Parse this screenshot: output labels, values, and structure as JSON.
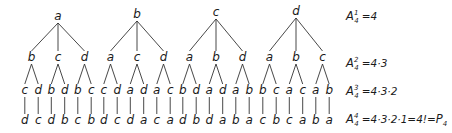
{
  "diagram": {
    "trees": [
      {
        "root": "a",
        "children": [
          {
            "label": "b",
            "children": [
              {
                "label": "c",
                "leaf": "d"
              },
              {
                "label": "d",
                "leaf": "c"
              }
            ]
          },
          {
            "label": "c",
            "children": [
              {
                "label": "b",
                "leaf": "d"
              },
              {
                "label": "d",
                "leaf": "b"
              }
            ]
          },
          {
            "label": "d",
            "children": [
              {
                "label": "b",
                "leaf": "c"
              },
              {
                "label": "c",
                "leaf": "b"
              }
            ]
          }
        ]
      },
      {
        "root": "b",
        "children": [
          {
            "label": "a",
            "children": [
              {
                "label": "c",
                "leaf": "d"
              },
              {
                "label": "d",
                "leaf": "c"
              }
            ]
          },
          {
            "label": "c",
            "children": [
              {
                "label": "a",
                "leaf": "d"
              },
              {
                "label": "d",
                "leaf": "a"
              }
            ]
          },
          {
            "label": "d",
            "children": [
              {
                "label": "a",
                "leaf": "c"
              },
              {
                "label": "c",
                "leaf": "a"
              }
            ]
          }
        ]
      },
      {
        "root": "c",
        "children": [
          {
            "label": "a",
            "children": [
              {
                "label": "b",
                "leaf": "d"
              },
              {
                "label": "d",
                "leaf": "b"
              }
            ]
          },
          {
            "label": "b",
            "children": [
              {
                "label": "a",
                "leaf": "d"
              },
              {
                "label": "d",
                "leaf": "a"
              }
            ]
          },
          {
            "label": "d",
            "children": [
              {
                "label": "a",
                "leaf": "b"
              },
              {
                "label": "b",
                "leaf": "a"
              }
            ]
          }
        ]
      },
      {
        "root": "d",
        "children": [
          {
            "label": "a",
            "children": [
              {
                "label": "b",
                "leaf": "c"
              },
              {
                "label": "c",
                "leaf": "b"
              }
            ]
          },
          {
            "label": "b",
            "children": [
              {
                "label": "a",
                "leaf": "c"
              },
              {
                "label": "c",
                "leaf": "a"
              }
            ]
          },
          {
            "label": "c",
            "children": [
              {
                "label": "a",
                "leaf": "b"
              },
              {
                "label": "b",
                "leaf": "a"
              }
            ]
          }
        ]
      }
    ],
    "formulas": [
      {
        "base": "A",
        "sup": "1",
        "sub": "4",
        "rhs": "=4"
      },
      {
        "base": "A",
        "sup": "2",
        "sub": "4",
        "rhs": "=4·3"
      },
      {
        "base": "A",
        "sup": "3",
        "sub": "4",
        "rhs": "=4·3·2"
      },
      {
        "base": "A",
        "sup": "4",
        "sub": "4",
        "rhs": "=4·3·2·1=4!=",
        "p": "P",
        "psub": "4"
      }
    ]
  }
}
